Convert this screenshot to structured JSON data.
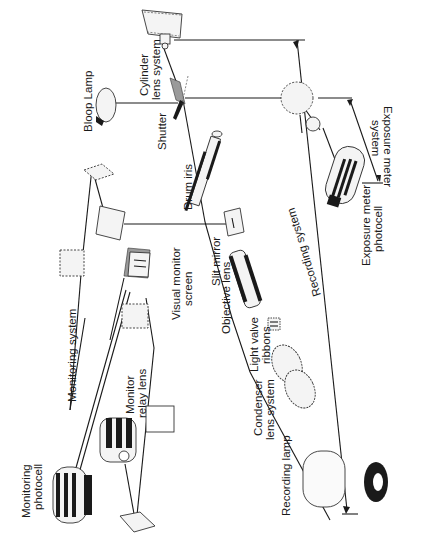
{
  "diagram": {
    "orientation": "rotated 90 degrees counter-clockwise",
    "colors": {
      "ink": "#1a1a1a",
      "background": "#ffffff",
      "shading": "#9a9a9a"
    },
    "components": {
      "bloop_lamp": "Bloop Lamp",
      "cylinder_lens_line1": "Cylinder",
      "cylinder_lens_line2": "lens system",
      "shutter": "Shutter",
      "drum_iris": "Drum iris",
      "exposure_meter_system_line1": "Exposure meter",
      "exposure_meter_system_line2": "system",
      "exposure_meter_photocell_line1": "Exposure meter",
      "exposure_meter_photocell_line2": "photocell",
      "recording_system": "Recording system",
      "slit_mirror": "Slit mirror",
      "objective_lens": "Objective lens",
      "visual_monitor_line1": "Visual monitor",
      "visual_monitor_line2": "screen",
      "light_valve_line1": "Light valve",
      "light_valve_line2": "ribbons",
      "condenser_line1": "Condenser",
      "condenser_line2": "lens system",
      "recording_lamp": "Recording lamp",
      "monitoring_system": "Monitoring system",
      "monitor_relay_line1": "Monitor",
      "monitor_relay_line2": "relay lens",
      "monitoring_photocell_line1": "Monitoring",
      "monitoring_photocell_line2": "photocell"
    }
  }
}
